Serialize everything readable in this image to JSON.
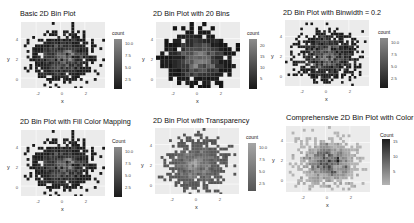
{
  "chart_data": [
    {
      "type": "heatmap",
      "title": "Basic 2D Bin Plot",
      "xlabel": "x",
      "ylabel": "y",
      "xticks": [
        "-2",
        "0",
        "2"
      ],
      "yticks": [
        "0",
        "2",
        "4"
      ],
      "xlim": [
        -3.2,
        3.6
      ],
      "ylim": [
        -0.8,
        5.2
      ],
      "legend": {
        "title": "count",
        "ticks": [
          "10.0",
          "7.5",
          "5.0",
          "2.5"
        ],
        "range": [
          1,
          11
        ]
      },
      "bins": 30,
      "palette": "dark-grey-low-light-high",
      "alpha": 1,
      "grid": true,
      "legend_position": "right"
    },
    {
      "type": "heatmap",
      "title": "2D Bin Plot with 20 Bins",
      "xlabel": "x",
      "ylabel": "y",
      "xticks": [
        "-2",
        "0",
        "2"
      ],
      "yticks": [
        "0",
        "2",
        "4"
      ],
      "xlim": [
        -3.2,
        3.6
      ],
      "ylim": [
        -0.8,
        5.2
      ],
      "legend": {
        "title": "count",
        "ticks": [
          "20",
          "15",
          "10",
          "5"
        ],
        "range": [
          1,
          24
        ]
      },
      "bins": 20,
      "palette": "dark-grey-low-light-high",
      "alpha": 1,
      "grid": true,
      "legend_position": "right"
    },
    {
      "type": "heatmap",
      "title": "2D Bin Plot with Binwidth = 0.2",
      "xlabel": "x",
      "ylabel": "y",
      "xticks": [
        "-2",
        "0",
        "2"
      ],
      "yticks": [
        "0",
        "2",
        "4"
      ],
      "xlim": [
        -3.2,
        3.6
      ],
      "ylim": [
        -0.8,
        5.2
      ],
      "legend": {
        "title": "count",
        "ticks": [
          "10.0",
          "7.5",
          "5.0",
          "2.5"
        ],
        "range": [
          1,
          11
        ]
      },
      "binwidth": 0.2,
      "palette": "dark-grey-low-light-high",
      "alpha": 1,
      "grid": true,
      "legend_position": "right"
    },
    {
      "type": "heatmap",
      "title": "2D Bin Plot with Fill Color Mapping",
      "xlabel": "x",
      "ylabel": "y",
      "xticks": [
        "-2",
        "0",
        "2"
      ],
      "yticks": [
        "0",
        "2",
        "4"
      ],
      "xlim": [
        -3.2,
        3.6
      ],
      "ylim": [
        -0.8,
        5.2
      ],
      "legend": {
        "title": "Count",
        "ticks": [
          "10.0",
          "7.5",
          "5.0",
          "2.5"
        ],
        "range": [
          1,
          11
        ]
      },
      "bins": 30,
      "palette": "dark-grey-low-light-high",
      "alpha": 1,
      "grid": true,
      "legend_position": "right"
    },
    {
      "type": "heatmap",
      "title": "2D Bin Plot with Transparency",
      "xlabel": "x",
      "ylabel": "y",
      "xticks": [
        "-2",
        "0",
        "2"
      ],
      "yticks": [
        "0",
        "2",
        "4"
      ],
      "xlim": [
        -3.2,
        3.6
      ],
      "ylim": [
        -0.8,
        5.2
      ],
      "legend": {
        "title": "count",
        "ticks": [
          "10.0",
          "7.5",
          "5.0",
          "2.5"
        ],
        "range": [
          1,
          11
        ]
      },
      "bins": 30,
      "palette": "dark-grey-low-light-high",
      "alpha": 0.7,
      "grid": true,
      "legend_position": "right"
    },
    {
      "type": "heatmap",
      "title": "Comprehensive 2D Bin Plot with Color",
      "xlabel": "x",
      "ylabel": "y",
      "xticks": [
        "-2",
        "0",
        "2"
      ],
      "yticks": [
        "0",
        "2",
        "4"
      ],
      "xlim": [
        -3.2,
        3.6
      ],
      "ylim": [
        -0.8,
        5.2
      ],
      "legend": {
        "title": "Count",
        "ticks": [
          "15",
          "10",
          "5"
        ],
        "range": [
          1,
          16
        ]
      },
      "bins": 30,
      "palette": "light-grey-low-dark-high",
      "alpha": 1,
      "grid": true,
      "legend_position": "right"
    }
  ],
  "panels": [
    {
      "title": "Basic 2D Bin Plot",
      "legend_title": "count",
      "legend_ticks": [
        "10.0",
        "7.5",
        "5.0",
        "2.5"
      ],
      "xlabel": "x",
      "ylabel": "y",
      "xticks": [
        "-2",
        "0",
        "2"
      ],
      "yticks": [
        "4",
        "2",
        "0"
      ]
    },
    {
      "title": "2D Bin Plot with 20 Bins",
      "legend_title": "count",
      "legend_ticks": [
        "20",
        "15",
        "10",
        "5"
      ],
      "xlabel": "x",
      "ylabel": "y",
      "xticks": [
        "-2",
        "0",
        "2"
      ],
      "yticks": [
        "4",
        "2",
        "0"
      ]
    },
    {
      "title": "2D Bin Plot with Binwidth = 0.2",
      "legend_title": "count",
      "legend_ticks": [
        "10.0",
        "7.5",
        "5.0",
        "2.5"
      ],
      "xlabel": "x",
      "ylabel": "y",
      "xticks": [
        "-2",
        "0",
        "2"
      ],
      "yticks": [
        "4",
        "2",
        "0"
      ]
    },
    {
      "title": "2D Bin Plot with Fill Color Mapping",
      "legend_title": "Count",
      "legend_ticks": [
        "10.0",
        "7.5",
        "5.0",
        "2.5"
      ],
      "xlabel": "x",
      "ylabel": "y",
      "xticks": [
        "-2",
        "0",
        "2"
      ],
      "yticks": [
        "4",
        "2",
        "0"
      ]
    },
    {
      "title": "2D Bin Plot with Transparency",
      "legend_title": "count",
      "legend_ticks": [
        "10.0",
        "7.5",
        "5.0",
        "2.5"
      ],
      "xlabel": "x",
      "ylabel": "y",
      "xticks": [
        "-2",
        "0",
        "2"
      ],
      "yticks": [
        "4",
        "2",
        "0"
      ]
    },
    {
      "title": "Comprehensive 2D Bin Plot with Color",
      "legend_title": "Count",
      "legend_ticks": [
        "15",
        "10",
        "5"
      ],
      "xlabel": "x",
      "ylabel": "y",
      "xticks": [
        "-2",
        "0",
        "2"
      ],
      "yticks": [
        "4",
        "2",
        "0"
      ]
    }
  ],
  "render": [
    {
      "cells": 30,
      "seed": 11,
      "low": "#1a1a1a",
      "high": "#8a8a8a",
      "alpha": 1,
      "spread": 1.0
    },
    {
      "cells": 20,
      "seed": 23,
      "low": "#161616",
      "high": "#8c8c8c",
      "alpha": 1,
      "spread": 1.0
    },
    {
      "cells": 33,
      "seed": 37,
      "low": "#1a1a1a",
      "high": "#8a8a8a",
      "alpha": 1,
      "spread": 1.0
    },
    {
      "cells": 30,
      "seed": 11,
      "low": "#1a1a1a",
      "high": "#8a8a8a",
      "alpha": 1,
      "spread": 1.0
    },
    {
      "cells": 30,
      "seed": 53,
      "low": "#1a1a1a",
      "high": "#8a8a8a",
      "alpha": 0.72,
      "spread": 1.0
    },
    {
      "cells": 30,
      "seed": 71,
      "low": "#b4b4b4",
      "high": "#1c1c1c",
      "alpha": 1,
      "spread": 1.0
    }
  ],
  "colors": {
    "plot_bg": "#ebebeb",
    "grid": "#ffffff",
    "text": "#222222",
    "tick_text": "#555555"
  }
}
